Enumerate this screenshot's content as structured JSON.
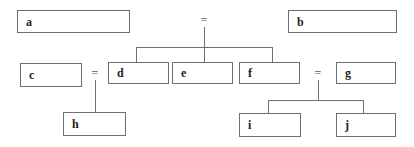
{
  "diagram": {
    "boxes": {
      "a": "a",
      "b": "b",
      "c": "c",
      "d": "d",
      "e": "e",
      "f": "f",
      "g": "g",
      "h": "h",
      "i": "i",
      "j": "j"
    },
    "operators": {
      "top_equals": "=",
      "c_equals": "=",
      "g_equals": "="
    },
    "relations": [
      {
        "equals": "top",
        "children": [
          "d",
          "e",
          "f"
        ]
      },
      {
        "left": "c",
        "operator": "=",
        "right": "d",
        "child": "h"
      },
      {
        "left": "f",
        "operator": "=",
        "right": "g",
        "children": [
          "i",
          "j"
        ]
      }
    ],
    "colors": {
      "border": "#6f6f6f",
      "line": "#707070",
      "text": "#222222"
    }
  }
}
